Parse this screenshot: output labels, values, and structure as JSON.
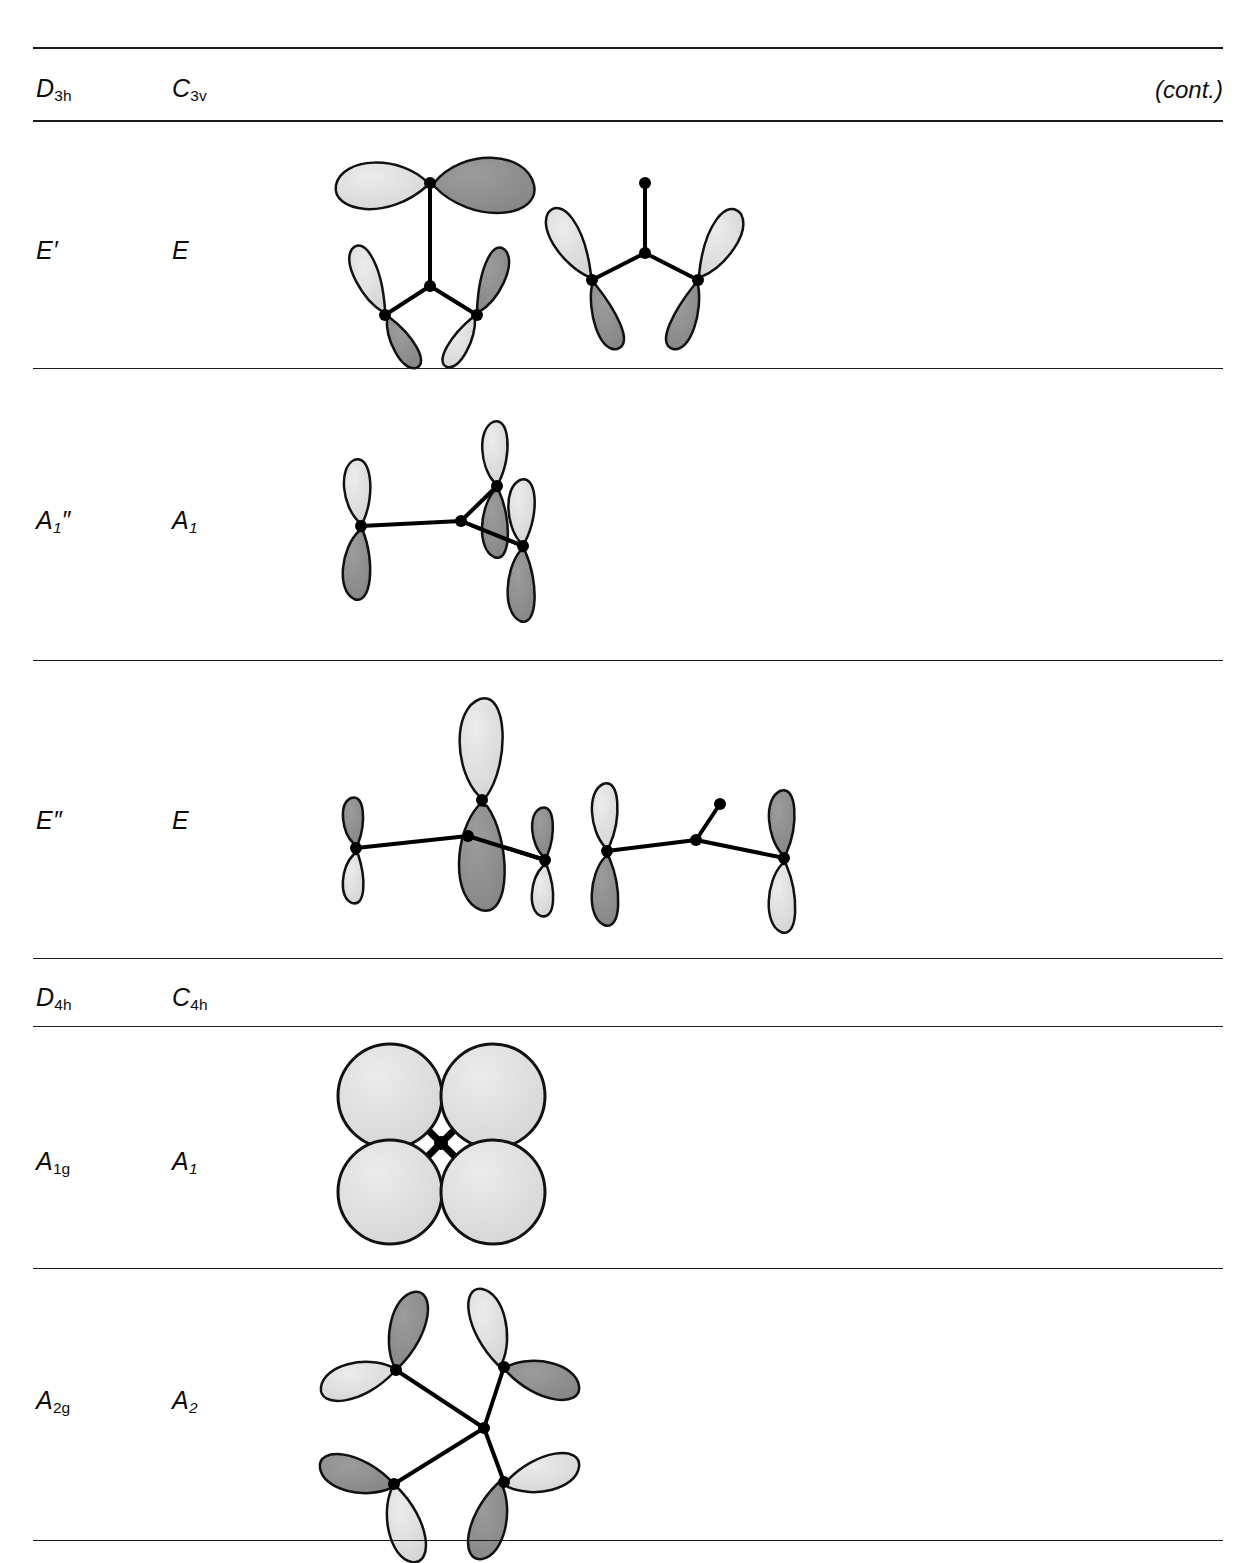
{
  "page": {
    "header_note": "(cont.)",
    "background": "#ffffff",
    "rule_color": "#1c1c1c"
  },
  "columns": {
    "left_header_group1": "D",
    "right_header_group1": "C"
  },
  "sections": [
    {
      "id": "d3h-c3v",
      "header": {
        "left": {
          "letter": "D",
          "sub": "3h"
        },
        "right": {
          "letter": "C",
          "sub": "3v"
        },
        "note": "(cont.)"
      },
      "rows": [
        {
          "id": "row-e-prime",
          "left": {
            "letter": "E",
            "prime": "′",
            "sub": ""
          },
          "right": {
            "letter": "E",
            "prime": "",
            "sub": ""
          },
          "diagram_count": 2,
          "diagram_kind": "trigonal-pi-perpendicular"
        },
        {
          "id": "row-a1-doubleprime",
          "left": {
            "letter": "A",
            "prime": "″",
            "sub": "1"
          },
          "right": {
            "letter": "A",
            "prime": "",
            "sub": "1"
          },
          "diagram_count": 1,
          "diagram_kind": "trigonal-pi-out-of-plane-symmetric"
        },
        {
          "id": "row-e-doubleprime",
          "left": {
            "letter": "E",
            "prime": "″",
            "sub": ""
          },
          "right": {
            "letter": "E",
            "prime": "",
            "sub": ""
          },
          "diagram_count": 2,
          "diagram_kind": "trigonal-pi-out-of-plane-antisymmetric"
        }
      ]
    },
    {
      "id": "d4h-c4h",
      "header": {
        "left": {
          "letter": "D",
          "sub": "4h"
        },
        "right": {
          "letter": "C",
          "sub": "4h"
        },
        "note": ""
      },
      "rows": [
        {
          "id": "row-a1g",
          "left": {
            "letter": "A",
            "prime": "",
            "sub": "1g"
          },
          "right": {
            "letter": "A",
            "prime": "",
            "sub": "1"
          },
          "diagram_count": 1,
          "diagram_kind": "square-sigma-all-in-phase"
        },
        {
          "id": "row-a2g",
          "left": {
            "letter": "A",
            "prime": "",
            "sub": "2g"
          },
          "right": {
            "letter": "A",
            "prime": "",
            "sub": "2"
          },
          "diagram_count": 1,
          "diagram_kind": "square-pi-tangential-pinwheel"
        }
      ]
    }
  ],
  "orbital_style": {
    "light_fill": "#dcdcdc",
    "dark_fill": "#8f8f8f",
    "outline": "#111111",
    "atom_dot": "#000000",
    "bond": "#000000",
    "highlight": "#ffffff"
  }
}
